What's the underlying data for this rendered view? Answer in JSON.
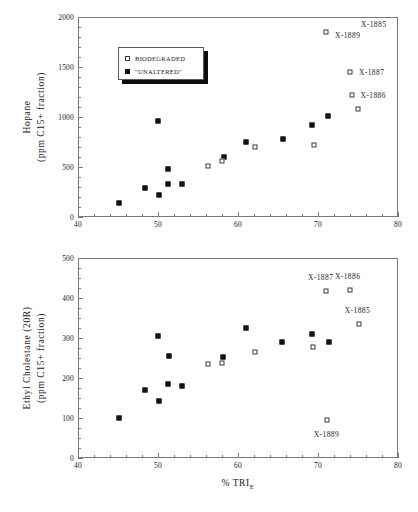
{
  "figure": {
    "xlabel_prefix": "% TRI",
    "xlabel_subscript": "E"
  },
  "legend": {
    "entries": [
      {
        "marker": "open-square",
        "label": "BIODEGRADED"
      },
      {
        "marker": "filled-square",
        "label": "\"UNALTERED\""
      }
    ]
  },
  "chart_data": [
    {
      "type": "scatter",
      "title": "",
      "panel": "top",
      "xlabel": "% TRI_E",
      "ylabel": "Hopane (ppm C15+ fraction)",
      "ylabel_line1": "Hopane",
      "ylabel_line2": "(ppm C15+ fraction)",
      "xlim": [
        40,
        80
      ],
      "ylim": [
        0,
        2000
      ],
      "xticks": [
        40,
        50,
        60,
        70,
        80
      ],
      "yticks": [
        0,
        500,
        1000,
        1500,
        2000
      ],
      "xtick_labels": [
        "40",
        "50",
        "60",
        "70",
        "80"
      ],
      "ytick_labels": [
        "0",
        "500",
        "1000",
        "1500",
        "2000"
      ],
      "x_minor_step": 2,
      "y_minor_step": 100,
      "grid": false,
      "legend_position": "upper-left-inset",
      "series": [
        {
          "name": "\"UNALTERED\"",
          "marker": "filled-square",
          "points": [
            {
              "x": 45.1,
              "y": 145
            },
            {
              "x": 48.4,
              "y": 290
            },
            {
              "x": 50.0,
              "y": 960
            },
            {
              "x": 50.1,
              "y": 225
            },
            {
              "x": 51.2,
              "y": 330
            },
            {
              "x": 51.3,
              "y": 480
            },
            {
              "x": 53.0,
              "y": 335
            },
            {
              "x": 58.2,
              "y": 600
            },
            {
              "x": 61.0,
              "y": 755
            },
            {
              "x": 65.6,
              "y": 785
            },
            {
              "x": 69.2,
              "y": 925
            },
            {
              "x": 71.3,
              "y": 1010
            }
          ]
        },
        {
          "name": "BIODEGRADED",
          "marker": "open-square",
          "points": [
            {
              "x": 56.2,
              "y": 510
            },
            {
              "x": 58.0,
              "y": 565
            },
            {
              "x": 62.1,
              "y": 705
            },
            {
              "x": 69.5,
              "y": 720
            },
            {
              "x": 71.0,
              "y": 1855
            },
            {
              "x": 74.0,
              "y": 1455
            },
            {
              "x": 74.2,
              "y": 1220
            },
            {
              "x": 75.0,
              "y": 1080
            }
          ]
        }
      ],
      "annotations": [
        {
          "text": "X-1889",
          "x": 71.0,
          "y": 1855,
          "dx": 9,
          "dy": 3
        },
        {
          "text": "X-1887",
          "x": 74.0,
          "y": 1455,
          "dx": 9,
          "dy": 0
        },
        {
          "text": "X-1886",
          "x": 74.2,
          "y": 1220,
          "dx": 9,
          "dy": 0
        },
        {
          "text": "X-1885",
          "x": 75.0,
          "y": 1080,
          "dx": 3,
          "dy": -85
        }
      ]
    },
    {
      "type": "scatter",
      "title": "",
      "panel": "bottom",
      "xlabel": "% TRI_E",
      "ylabel": "Ethyl Cholestane (20R) (ppm C15+ fraction)",
      "ylabel_line1": "Ethyl Cholestane (20R)",
      "ylabel_line2": "(ppm C15+ fraction)",
      "xlim": [
        40,
        80
      ],
      "ylim": [
        0,
        500
      ],
      "xticks": [
        40,
        50,
        60,
        70,
        80
      ],
      "yticks": [
        0,
        100,
        200,
        300,
        400,
        500
      ],
      "xtick_labels": [
        "40",
        "50",
        "60",
        "70",
        "80"
      ],
      "ytick_labels": [
        "0",
        "100",
        "200",
        "300",
        "400",
        "500"
      ],
      "x_minor_step": 2,
      "y_minor_step": 25,
      "grid": false,
      "legend_position": "none",
      "series": [
        {
          "name": "\"UNALTERED\"",
          "marker": "filled-square",
          "points": [
            {
              "x": 45.1,
              "y": 100
            },
            {
              "x": 48.4,
              "y": 170
            },
            {
              "x": 50.0,
              "y": 304
            },
            {
              "x": 50.1,
              "y": 142
            },
            {
              "x": 51.2,
              "y": 185
            },
            {
              "x": 51.4,
              "y": 255
            },
            {
              "x": 53.0,
              "y": 181
            },
            {
              "x": 58.1,
              "y": 253
            },
            {
              "x": 61.0,
              "y": 324
            },
            {
              "x": 65.5,
              "y": 289
            },
            {
              "x": 69.2,
              "y": 310
            },
            {
              "x": 71.4,
              "y": 291
            }
          ]
        },
        {
          "name": "BIODEGRADED",
          "marker": "open-square",
          "points": [
            {
              "x": 56.2,
              "y": 236
            },
            {
              "x": 58.0,
              "y": 238
            },
            {
              "x": 62.1,
              "y": 265
            },
            {
              "x": 69.4,
              "y": 277
            },
            {
              "x": 71.1,
              "y": 95
            },
            {
              "x": 71.0,
              "y": 417
            },
            {
              "x": 74.0,
              "y": 420
            },
            {
              "x": 75.1,
              "y": 336
            }
          ]
        }
      ],
      "annotations": [
        {
          "text": "X-1887",
          "x": 71.0,
          "y": 417,
          "dx": -18,
          "dy": -14
        },
        {
          "text": "X-1886",
          "x": 74.0,
          "y": 420,
          "dx": -15,
          "dy": -14
        },
        {
          "text": "X-1885",
          "x": 75.1,
          "y": 336,
          "dx": -14,
          "dy": -14
        },
        {
          "text": "X-1889",
          "x": 71.1,
          "y": 95,
          "dx": -13,
          "dy": 14
        }
      ]
    }
  ]
}
